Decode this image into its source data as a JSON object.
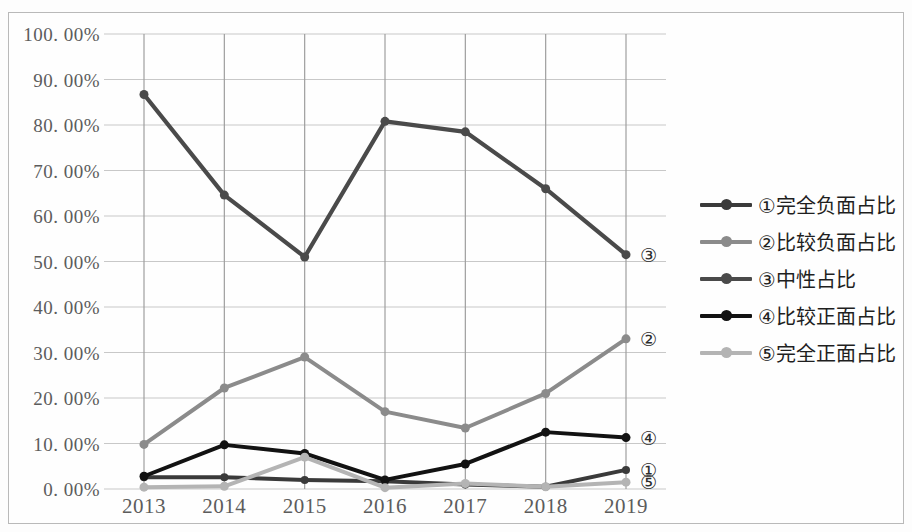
{
  "chart_data": {
    "type": "line",
    "title": "",
    "subtitle": "",
    "xlabel": "",
    "ylabel": "",
    "x": [
      "2013",
      "2014",
      "2015",
      "2016",
      "2017",
      "2018",
      "2019"
    ],
    "categories": [
      "2013",
      "2014",
      "2015",
      "2016",
      "2017",
      "2018",
      "2019"
    ],
    "ylim": [
      0,
      100
    ],
    "ytick_values": [
      0,
      10,
      20,
      30,
      40,
      50,
      60,
      70,
      80,
      90,
      100
    ],
    "ytick_labels": [
      "0. 00%",
      "10. 00%",
      "20. 00%",
      "30. 00%",
      "40. 00%",
      "50. 00%",
      "60. 00%",
      "70. 00%",
      "80. 00%",
      "90. 00%",
      "100. 00%"
    ],
    "grid": {
      "horizontal": true,
      "vertical": true
    },
    "legend_position": "right",
    "markers": true,
    "series": [
      {
        "key": "s1",
        "name": "①完全负面占比",
        "marker_label": "①",
        "color": "#3a3a3a",
        "line_width": 4.0,
        "marker_size": 8,
        "values": [
          2.6,
          2.6,
          2.0,
          1.7,
          1.0,
          0.5,
          4.2
        ]
      },
      {
        "key": "s2",
        "name": "②比较负面占比",
        "marker_label": "②",
        "color": "#8b8b8b",
        "line_width": 4.0,
        "marker_size": 9,
        "values": [
          9.8,
          22.2,
          29.0,
          17.0,
          13.4,
          21.0,
          33.0
        ]
      },
      {
        "key": "s3",
        "name": "③中性占比",
        "marker_label": "③",
        "color": "#4a4a4a",
        "line_width": 4.2,
        "marker_size": 9,
        "values": [
          86.7,
          64.6,
          51.0,
          80.8,
          78.5,
          66.0,
          51.5
        ]
      },
      {
        "key": "s4",
        "name": "④比较正面占比",
        "marker_label": "④",
        "color": "#121212",
        "line_width": 4.0,
        "marker_size": 9,
        "values": [
          2.8,
          9.7,
          7.8,
          2.0,
          5.5,
          12.5,
          11.3
        ]
      },
      {
        "key": "s5",
        "name": "⑤完全正面占比",
        "marker_label": "⑤",
        "color": "#b4b4b4",
        "line_width": 4.0,
        "marker_size": 9,
        "values": [
          0.4,
          0.6,
          7.0,
          0.3,
          1.2,
          0.5,
          1.5
        ]
      }
    ],
    "endpoint_annotations": [
      {
        "label": "③",
        "value": 51.5
      },
      {
        "label": "②",
        "value": 33.0
      },
      {
        "label": "④",
        "value": 11.3
      },
      {
        "label": "①",
        "value": 4.2
      },
      {
        "label": "⑤",
        "value": 1.5
      }
    ]
  },
  "style": {
    "plot_background": "#fefefe",
    "grid_color": "#c8c8c8",
    "border_color": "#b9b9b9",
    "tick_text_color": "#5c5c5c"
  }
}
